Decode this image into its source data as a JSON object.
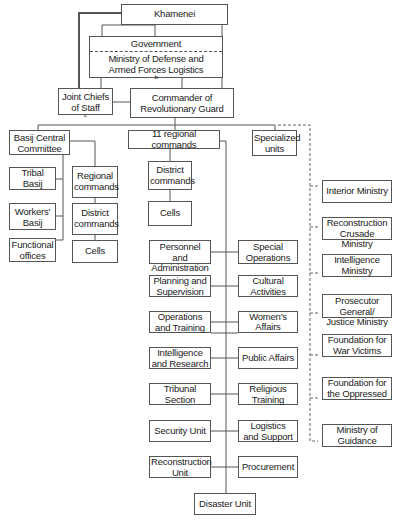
{
  "chart_data": {
    "type": "org-chart",
    "title": "",
    "nodes": [
      {
        "id": "khamenei",
        "label": "Khamenei"
      },
      {
        "id": "government",
        "label": "Government"
      },
      {
        "id": "modafl",
        "label": "Ministry of Defense and Armed Forces Logistics",
        "footnote": "b"
      },
      {
        "id": "jcs",
        "label": "Joint Chiefs of Staff",
        "footnote": "c"
      },
      {
        "id": "cmdr",
        "label": "Commander of Revolutionary Guard"
      },
      {
        "id": "basij",
        "label": "Basij Central Committee"
      },
      {
        "id": "regional11",
        "label": "11 regional commands"
      },
      {
        "id": "specialized",
        "label": "Specialized units"
      },
      {
        "id": "tribal",
        "label": "Tribal Basij"
      },
      {
        "id": "workers",
        "label": "Workers' Basij"
      },
      {
        "id": "functional",
        "label": "Functional offices"
      },
      {
        "id": "b_regional",
        "label": "Regional commands"
      },
      {
        "id": "b_district",
        "label": "District commands"
      },
      {
        "id": "b_cells",
        "label": "Cells"
      },
      {
        "id": "r_district",
        "label": "District commands"
      },
      {
        "id": "r_cells",
        "label": "Cells"
      },
      {
        "id": "personnel",
        "label": "Personnel and Administration"
      },
      {
        "id": "specialops",
        "label": "Special Operations"
      },
      {
        "id": "planning",
        "label": "Planning and Supervision"
      },
      {
        "id": "cultural",
        "label": "Cultural Activities"
      },
      {
        "id": "operations",
        "label": "Operations and Training"
      },
      {
        "id": "women",
        "label": "Women's Affairs"
      },
      {
        "id": "intel",
        "label": "Intelligence and Research"
      },
      {
        "id": "public",
        "label": "Public Affairs"
      },
      {
        "id": "tribunal",
        "label": "Tribunal Section"
      },
      {
        "id": "religious",
        "label": "Religious Training"
      },
      {
        "id": "security",
        "label": "Security Unit"
      },
      {
        "id": "logistics",
        "label": "Logistics and Support"
      },
      {
        "id": "reconstruction",
        "label": "Reconstruction Unit"
      },
      {
        "id": "procurement",
        "label": "Procurement"
      },
      {
        "id": "disaster",
        "label": "Disaster Unit"
      },
      {
        "id": "interior",
        "label": "Interior Ministry"
      },
      {
        "id": "recon_crusade",
        "label": "Reconstruction Crusade Ministry"
      },
      {
        "id": "intel_ministry",
        "label": "Intelligence Ministry"
      },
      {
        "id": "prosecutor",
        "label": "Prosecutor General/ Justice Ministry"
      },
      {
        "id": "war_victims",
        "label": "Foundation for War Victims"
      },
      {
        "id": "oppressed",
        "label": "Foundation for the Oppressed"
      },
      {
        "id": "guidance",
        "label": "Ministry of Guidance"
      }
    ],
    "edges_solid": [
      [
        "khamenei",
        "jcs"
      ],
      [
        "khamenei",
        "government"
      ],
      [
        "khamenei",
        "cmdr"
      ],
      [
        "modafl",
        "cmdr"
      ],
      [
        "jcs",
        "cmdr"
      ],
      [
        "cmdr",
        "basij"
      ],
      [
        "cmdr",
        "regional11"
      ],
      [
        "cmdr",
        "specialized"
      ],
      [
        "basij",
        "tribal"
      ],
      [
        "basij",
        "workers"
      ],
      [
        "basij",
        "functional"
      ],
      [
        "basij",
        "b_regional"
      ],
      [
        "b_regional",
        "b_district"
      ],
      [
        "b_district",
        "b_cells"
      ],
      [
        "regional11",
        "r_district"
      ],
      [
        "r_district",
        "r_cells"
      ],
      [
        "regional11",
        "personnel"
      ],
      [
        "regional11",
        "specialops"
      ],
      [
        "regional11",
        "planning"
      ],
      [
        "regional11",
        "cultural"
      ],
      [
        "regional11",
        "operations"
      ],
      [
        "regional11",
        "women"
      ],
      [
        "regional11",
        "intel"
      ],
      [
        "regional11",
        "public"
      ],
      [
        "regional11",
        "tribunal"
      ],
      [
        "regional11",
        "religious"
      ],
      [
        "regional11",
        "security"
      ],
      [
        "regional11",
        "logistics"
      ],
      [
        "regional11",
        "reconstruction"
      ],
      [
        "regional11",
        "procurement"
      ],
      [
        "regional11",
        "disaster"
      ]
    ],
    "edges_dashed": [
      [
        "specialized",
        "interior"
      ],
      [
        "specialized",
        "recon_crusade"
      ],
      [
        "specialized",
        "intel_ministry"
      ],
      [
        "specialized",
        "prosecutor"
      ],
      [
        "specialized",
        "war_victims"
      ],
      [
        "specialized",
        "oppressed"
      ],
      [
        "specialized",
        "guidance"
      ]
    ]
  },
  "top": {
    "khamenei": "Khamenei",
    "government": "Government",
    "modafl_1": "Ministry of Defense and",
    "modafl_2": "Armed Forces Logistics",
    "modafl_fn": "b",
    "jcs_1": "Joint Chiefs",
    "jcs_2": "of Staff",
    "jcs_fn": "c",
    "cmdr_1": "Commander of",
    "cmdr_2": "Revolutionary Guard"
  },
  "tier2": {
    "basij_1": "Basij Central",
    "basij_2": "Committee",
    "regional11": "11 regional commands",
    "specialized_1": "Specialized",
    "specialized_2": "units"
  },
  "basij": {
    "tribal": "Tribal Basij",
    "workers_1": "Workers'",
    "workers_2": "Basij",
    "functional_1": "Functional",
    "functional_2": "offices",
    "regional_1": "Regional",
    "regional_2": "commands",
    "district_1": "District",
    "district_2": "commands",
    "cells": "Cells"
  },
  "regional": {
    "district_1": "District",
    "district_2": "commands",
    "cells": "Cells",
    "left": [
      [
        "Personnel and",
        "Administration"
      ],
      [
        "Planning and",
        "Supervision"
      ],
      [
        "Operations",
        "and Training"
      ],
      [
        "Intelligence",
        "and Research"
      ],
      [
        "Tribunal",
        "Section"
      ],
      [
        "Security Unit",
        ""
      ],
      [
        "Reconstruction",
        "Unit"
      ]
    ],
    "right": [
      [
        "Special",
        "Operations"
      ],
      [
        "Cultural",
        "Activities"
      ],
      [
        "Women's Affairs",
        ""
      ],
      [
        "Public Affairs",
        ""
      ],
      [
        "Religious",
        "Training"
      ],
      [
        "Logistics",
        "and Support"
      ],
      [
        "Procurement",
        ""
      ]
    ],
    "disaster": "Disaster Unit"
  },
  "ministries": [
    [
      "Interior Ministry",
      ""
    ],
    [
      "Reconstruction",
      "Crusade Ministry"
    ],
    [
      "Intelligence",
      "Ministry"
    ],
    [
      "Prosecutor General/",
      "Justice Ministry"
    ],
    [
      "Foundation for",
      "War Victims"
    ],
    [
      "Foundation for",
      "the Oppressed"
    ],
    [
      "Ministry of",
      "Guidance"
    ]
  ]
}
